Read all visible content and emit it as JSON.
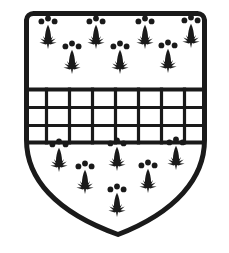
{
  "image": {
    "kind": "heraldic-shield-woodcut",
    "width": 229,
    "height": 253,
    "background_color": "#ffffff",
    "ink_color": "#1a1a1a",
    "title": "Coat of arms: shield with fess fretty between ermine spots"
  },
  "shield": {
    "name": "escutcheon",
    "outline_color": "#1a1a1a",
    "field_color": "#ffffff",
    "stroke_width": 5,
    "geometry": {
      "left_x": 24,
      "right_x": 207,
      "top_y": 13,
      "point_x": 118,
      "point_y": 237,
      "corner_radius": 7,
      "shoulder_y": 140
    }
  },
  "ordinary": {
    "name": "fess-fretty",
    "label": "Fess fretty",
    "top_y": 88,
    "bottom_y": 143,
    "line_color": "#1a1a1a",
    "line_width": 3.2,
    "border_width": 4,
    "rows": 3,
    "columns": 8,
    "horizontal_lines_y": [
      89,
      107,
      125,
      142
    ],
    "vertical_lines_x": [
      46,
      69,
      92,
      115,
      138,
      161,
      184
    ]
  },
  "charges": {
    "name": "ermine-spots",
    "label": "Ermine spot",
    "color": "#1a1a1a",
    "count_total": 13,
    "chief": {
      "label": "Chief",
      "count": 7,
      "spots": [
        {
          "x": 48,
          "y": 32,
          "scale": 1.0
        },
        {
          "x": 96,
          "y": 32,
          "scale": 1.0
        },
        {
          "x": 145,
          "y": 32,
          "scale": 1.0
        },
        {
          "x": 191,
          "y": 31,
          "scale": 1.0
        },
        {
          "x": 72,
          "y": 57,
          "scale": 1.0
        },
        {
          "x": 120,
          "y": 57,
          "scale": 1.0
        },
        {
          "x": 168,
          "y": 56,
          "scale": 1.0
        }
      ]
    },
    "base": {
      "label": "Base",
      "count": 6,
      "spots": [
        {
          "x": 59,
          "y": 155,
          "scale": 1.0
        },
        {
          "x": 117,
          "y": 154,
          "scale": 1.0
        },
        {
          "x": 176,
          "y": 153,
          "scale": 1.0
        },
        {
          "x": 85,
          "y": 177,
          "scale": 1.0
        },
        {
          "x": 148,
          "y": 176,
          "scale": 1.0
        },
        {
          "x": 117,
          "y": 200,
          "scale": 1.0
        }
      ]
    }
  }
}
